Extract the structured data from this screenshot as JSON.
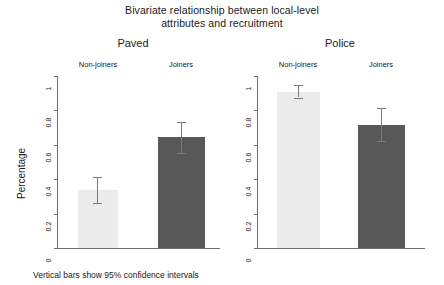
{
  "chart_data": {
    "type": "bar",
    "title": "Bivariate relationship between local-level attributes and recruitment",
    "title_line1": "Bivariate relationship between local-level",
    "title_line2": "attributes and recruitment",
    "xlabel": "",
    "ylabel": "Percentage",
    "ylim": [
      0,
      1
    ],
    "ytick_labels": [
      "0",
      "0.2",
      "0.4",
      "0.6",
      "0.8",
      "1"
    ],
    "ytick_values": [
      0,
      0.2,
      0.4,
      0.6,
      0.8,
      1
    ],
    "grid": false,
    "legend": "none",
    "footnote": "Vertical bars show 95% confidence intervals",
    "categories": [
      "Non-joiners",
      "Joiners"
    ],
    "panels": [
      {
        "name": "Paved",
        "bars": [
          {
            "category": "Non-joiners",
            "value": 0.335,
            "ci_low": 0.26,
            "ci_high": 0.415,
            "color": "#ebebeb"
          },
          {
            "category": "Joiners",
            "value": 0.645,
            "ci_low": 0.555,
            "ci_high": 0.735,
            "color": "#585858"
          }
        ]
      },
      {
        "name": "Police",
        "bars": [
          {
            "category": "Non-joiners",
            "value": 0.905,
            "ci_low": 0.875,
            "ci_high": 0.945,
            "color": "#ebebeb"
          },
          {
            "category": "Joiners",
            "value": 0.715,
            "ci_low": 0.62,
            "ci_high": 0.815,
            "color": "#585858"
          }
        ]
      }
    ],
    "axis_color": "#6e6e6e",
    "error_bar_color": "#7a7a7a"
  }
}
